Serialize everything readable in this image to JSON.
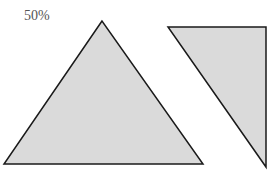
{
  "label": "50%",
  "colors": {
    "fill": "#dadada",
    "stroke": "#1a1a1a",
    "text": "#555555"
  },
  "shapes": [
    {
      "name": "isosceles-triangle",
      "points": "102,21 4,164 203,164"
    },
    {
      "name": "right-triangle",
      "points": "168,27 266,27 266,167"
    }
  ]
}
